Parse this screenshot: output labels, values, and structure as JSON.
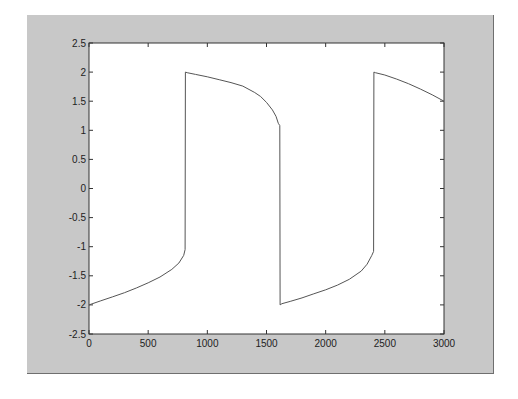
{
  "chart_data": {
    "type": "line",
    "title": "",
    "xlabel": "",
    "ylabel": "",
    "xlim": [
      0,
      3000
    ],
    "ylim": [
      -2.5,
      2.5
    ],
    "grid": false,
    "legend": null,
    "xticks": [
      "0",
      "500",
      "1000",
      "1500",
      "2000",
      "2500",
      "3000"
    ],
    "yticks": [
      "2.5",
      "2",
      "1.5",
      "1",
      "0.5",
      "0",
      "-0.5",
      "-1",
      "-1.5",
      "-2",
      "-2.5"
    ],
    "series": [
      {
        "name": "square-wave",
        "color": "#555555",
        "x": [
          0,
          100,
          200,
          300,
          400,
          500,
          600,
          700,
          760,
          800,
          812,
          815,
          830,
          900,
          1000,
          1100,
          1200,
          1300,
          1400,
          1450,
          1500,
          1550,
          1580,
          1600,
          1612,
          1615,
          1630,
          1700,
          1800,
          1900,
          2000,
          2100,
          2200,
          2300,
          2350,
          2390,
          2405,
          2408,
          2420,
          2500,
          2600,
          2700,
          2800,
          2900,
          3000
        ],
        "y": [
          -2.0,
          -1.93,
          -1.86,
          -1.79,
          -1.71,
          -1.62,
          -1.52,
          -1.39,
          -1.28,
          -1.15,
          -1.05,
          2.0,
          1.99,
          1.96,
          1.92,
          1.87,
          1.82,
          1.76,
          1.65,
          1.58,
          1.48,
          1.35,
          1.24,
          1.12,
          1.08,
          -2.0,
          -1.98,
          -1.94,
          -1.88,
          -1.81,
          -1.74,
          -1.66,
          -1.56,
          -1.42,
          -1.3,
          -1.15,
          -1.08,
          2.0,
          1.99,
          1.95,
          1.88,
          1.8,
          1.71,
          1.61,
          1.5
        ]
      }
    ]
  },
  "colors": {
    "figure_background": "#c8c8c8",
    "axes_background": "#ffffff",
    "axes_edge": "#333333",
    "line": "#555555"
  }
}
